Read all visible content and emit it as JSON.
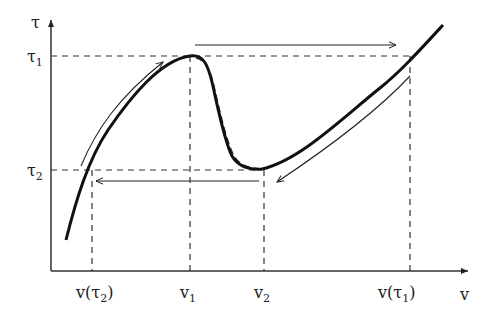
{
  "diagram": {
    "type": "hysteresis / non-monotonic constitutive curve",
    "axes": {
      "y_label": "τ",
      "x_label": "v"
    },
    "y_ticks": [
      {
        "base": "τ",
        "sub": "1"
      },
      {
        "base": "τ",
        "sub": "2"
      }
    ],
    "x_ticks": [
      {
        "text_before": "v(τ",
        "sub": "2",
        "text_after": ")"
      },
      {
        "base": "v",
        "sub": "1"
      },
      {
        "base": "v",
        "sub": "2"
      },
      {
        "text_before": "v(τ",
        "sub": "1",
        "text_after": ")"
      }
    ],
    "curves": {
      "solid": "non-monotonic curve: rising to local max (v1, τ1), falling to local min (v2, τ2), rising again",
      "dashed": "alternative branch near descending segment"
    },
    "arrows": [
      {
        "name": "loading-up-left-branch",
        "direction": "up along left branch toward τ1"
      },
      {
        "name": "jump-right-at-tau1",
        "direction": "horizontal right at τ1 from v1 to v(τ1)"
      },
      {
        "name": "unloading-down-right-branch",
        "direction": "down along right branch toward τ2"
      },
      {
        "name": "jump-left-at-tau2",
        "direction": "horizontal left at τ2 from v2 to v(τ2)"
      }
    ],
    "colors": {
      "stroke": "#111111",
      "thin_stroke": "#333333",
      "dash": "#333333",
      "background": "#ffffff"
    }
  }
}
